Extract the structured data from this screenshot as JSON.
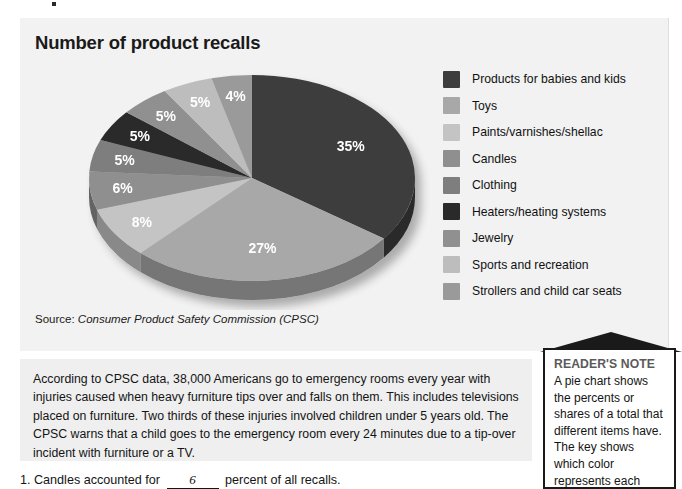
{
  "chart_panel": {
    "title": "Number of product recalls",
    "source_prefix": "Source: ",
    "source_name": "Consumer Product Safety Commission (CPSC)"
  },
  "chart_data": {
    "type": "pie",
    "title": "Number of product recalls",
    "source": "Consumer Product Safety Commission (CPSC)",
    "unit": "percent",
    "legend_position": "right",
    "grid": false,
    "categories": [
      "Products for babies and kids",
      "Toys",
      "Paints/varnishes/shellac",
      "Candles",
      "Clothing",
      "Heaters/heating systems",
      "Jewelry",
      "Sports and recreation",
      "Strollers and child car seats"
    ],
    "values": [
      35,
      27,
      8,
      6,
      5,
      5,
      5,
      5,
      4
    ],
    "labels": [
      "35%",
      "27%",
      "8%",
      "6%",
      "5%",
      "5%",
      "5%",
      "5%",
      "4%"
    ],
    "colors": [
      "#3d3d3d",
      "#a8a8a8",
      "#c4c4c4",
      "#8f8f8f",
      "#7e7e7e",
      "#2a2a2a",
      "#909090",
      "#bdbdbd",
      "#9a9a9a"
    ]
  },
  "legend": {
    "items": [
      {
        "label": "Products for babies and kids",
        "color": "#3d3d3d"
      },
      {
        "label": "Toys",
        "color": "#a8a8a8"
      },
      {
        "label": "Paints/varnishes/shellac",
        "color": "#c4c4c4"
      },
      {
        "label": "Candles",
        "color": "#8f8f8f"
      },
      {
        "label": "Clothing",
        "color": "#7e7e7e"
      },
      {
        "label": "Heaters/heating systems",
        "color": "#2a2a2a"
      },
      {
        "label": "Jewelry",
        "color": "#909090"
      },
      {
        "label": "Sports and recreation",
        "color": "#bdbdbd"
      },
      {
        "label": "Strollers and child car seats",
        "color": "#9a9a9a"
      }
    ]
  },
  "body": {
    "paragraph": "According to CPSC data, 38,000 Americans go to emergency rooms every year with injuries caused when heavy furniture tips over and falls on them. This includes televisions placed on furniture. Two thirds of these injuries involved children under 5 years old. The CPSC warns that a child goes to the emergency room every 24 minutes due to a tip-over incident with furniture or a TV."
  },
  "question": {
    "number": "1.",
    "text_before": "Candles accounted for",
    "answer": "6",
    "text_after": "percent of all recalls."
  },
  "reader_note": {
    "title": "READER'S NOTE",
    "text": "A pie chart shows the percents or shares of a total that different items have. The key shows which color represents each"
  }
}
